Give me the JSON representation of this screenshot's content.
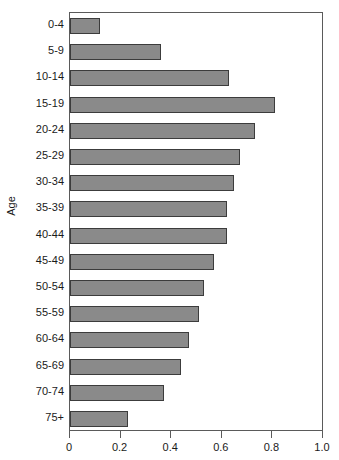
{
  "chart_data": {
    "type": "bar",
    "orientation": "horizontal",
    "title": "",
    "subtitle": "",
    "xlabel": "",
    "ylabel": "Age",
    "xlim": [
      0,
      1.0
    ],
    "grid": false,
    "legend": null,
    "legend_position": "none",
    "bar_color": "#8a8a8a",
    "bar_border_color": "#3c3c3c",
    "axis_color": "#5a5a5a",
    "text_color": "#1a1a1a",
    "xticks": [
      "0",
      "0.2",
      "0.4",
      "0.6",
      "0.8",
      "1.0"
    ],
    "xtick_values": [
      0,
      0.2,
      0.4,
      0.6,
      0.8,
      1.0
    ],
    "categories": [
      "0-4",
      "5-9",
      "10-14",
      "15-19",
      "20-24",
      "25-29",
      "30-34",
      "35-39",
      "40-44",
      "45-49",
      "50-54",
      "55-59",
      "60-64",
      "65-69",
      "70-74",
      "75+"
    ],
    "values": [
      0.12,
      0.36,
      0.63,
      0.81,
      0.73,
      0.67,
      0.65,
      0.62,
      0.62,
      0.57,
      0.53,
      0.51,
      0.47,
      0.44,
      0.37,
      0.23
    ]
  }
}
